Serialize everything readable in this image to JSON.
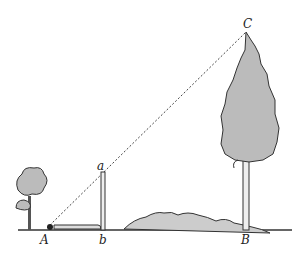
{
  "diagram": {
    "labels": {
      "A": "A",
      "b": "b",
      "B": "B",
      "a": "a",
      "C": "C"
    },
    "points": {
      "A": [
        47,
        230
      ],
      "b": [
        103,
        230
      ],
      "B": [
        246,
        230
      ],
      "a": [
        103,
        172
      ],
      "C": [
        246,
        32
      ]
    },
    "colors": {
      "line": "#333333",
      "foliage": "#b8b8b8",
      "foliage_dark": "#8a8a8a",
      "ground": "#444444"
    }
  }
}
